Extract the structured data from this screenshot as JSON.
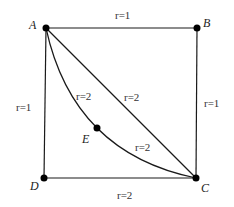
{
  "diagram": {
    "type": "weighted graph on a square",
    "nodes": [
      {
        "id": "A",
        "label": "A",
        "x": 46,
        "y": 28
      },
      {
        "id": "B",
        "label": "B",
        "x": 197,
        "y": 28
      },
      {
        "id": "C",
        "label": "C",
        "x": 196,
        "y": 178
      },
      {
        "id": "D",
        "label": "D",
        "x": 44,
        "y": 178
      },
      {
        "id": "E",
        "label": "E",
        "x": 97,
        "y": 128
      }
    ],
    "edges": [
      {
        "id": "AB",
        "from": "A",
        "to": "B",
        "shape": "straight",
        "label": "r=1"
      },
      {
        "id": "BC",
        "from": "B",
        "to": "C",
        "shape": "straight",
        "label": "r=1"
      },
      {
        "id": "AD",
        "from": "A",
        "to": "D",
        "shape": "straight",
        "label": "r=1"
      },
      {
        "id": "DC",
        "from": "D",
        "to": "C",
        "shape": "straight",
        "label": "r=2"
      },
      {
        "id": "AC",
        "from": "A",
        "to": "C",
        "shape": "straight diagonal",
        "label": "r=2"
      },
      {
        "id": "AE",
        "from": "A",
        "to": "E",
        "shape": "curved arc",
        "label": "r=2"
      },
      {
        "id": "EC",
        "from": "E",
        "to": "C",
        "shape": "curved arc",
        "label": "r=2"
      }
    ],
    "labels": {
      "A": "A",
      "B": "B",
      "C": "C",
      "D": "D",
      "E": "E",
      "top": "r=1",
      "right": "r=1",
      "left": "r=1",
      "bottom": "r=2",
      "diagonal": "r=2",
      "arc_upper": "r=2",
      "arc_lower": "r=2"
    },
    "colors": {
      "line": "#1a1a1a",
      "node": "#000000",
      "background": "#ffffff"
    }
  }
}
